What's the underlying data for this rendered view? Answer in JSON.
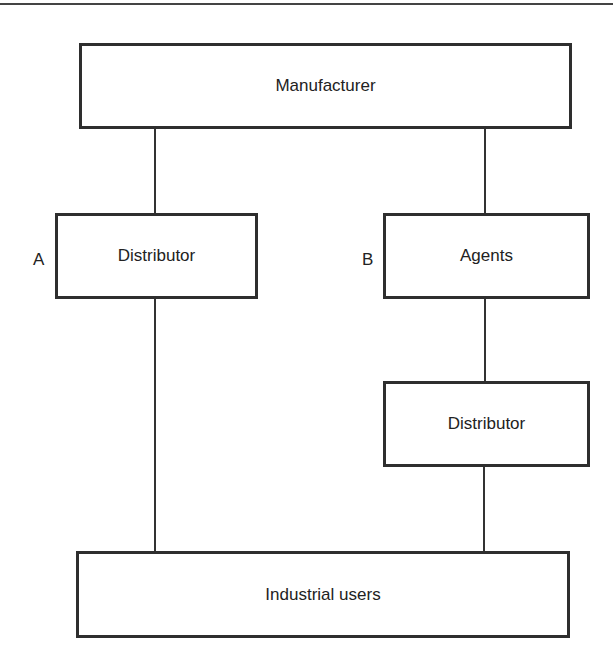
{
  "diagram": {
    "type": "distribution-channel-flow",
    "nodes": {
      "manufacturer": {
        "label": "Manufacturer"
      },
      "distributor_a": {
        "label": "Distributor"
      },
      "agents_b": {
        "label": "Agents"
      },
      "distributor_b": {
        "label": "Distributor"
      },
      "industrial_users": {
        "label": "Industrial users"
      }
    },
    "channel_labels": {
      "a": "A",
      "b": "B"
    },
    "edges": [
      {
        "from": "manufacturer",
        "to": "distributor_a"
      },
      {
        "from": "manufacturer",
        "to": "agents_b"
      },
      {
        "from": "agents_b",
        "to": "distributor_b"
      },
      {
        "from": "distributor_a",
        "to": "industrial_users"
      },
      {
        "from": "distributor_b",
        "to": "industrial_users"
      }
    ],
    "colors": {
      "stroke": "#2e2e2e",
      "background": "#ffffff",
      "text": "#222222"
    }
  }
}
